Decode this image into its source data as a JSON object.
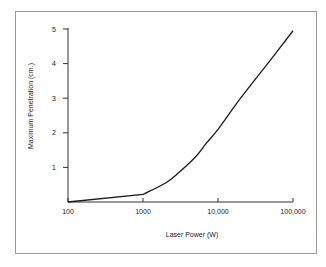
{
  "chart_data": {
    "type": "line",
    "title": "",
    "xlabel": "Laser Power (W)",
    "ylabel": "Maximum Penetration (cm.)",
    "xscale": "log",
    "xlim": [
      100,
      100000
    ],
    "ylim": [
      0,
      5
    ],
    "x_ticks": [
      100,
      1000,
      10000,
      100000
    ],
    "x_tick_labels": [
      "100",
      "1000",
      "10,000",
      "100,000"
    ],
    "y_ticks": [
      1,
      2,
      3,
      4,
      5
    ],
    "y_tick_labels": [
      "1",
      "2",
      "3",
      "4",
      "5"
    ],
    "grid": false,
    "legend": null,
    "series": [
      {
        "name": "Maximum Penetration",
        "x": [
          100,
          1000,
          2000,
          3000,
          5000,
          7000,
          10000,
          20000,
          50000,
          100000
        ],
        "y": [
          0,
          0.22,
          0.55,
          0.85,
          1.3,
          1.7,
          2.1,
          3.0,
          4.1,
          4.95
        ]
      }
    ]
  },
  "colors": {
    "line": "#1a1a1a",
    "axis": "#333333",
    "frame": "#9a9a9a"
  }
}
